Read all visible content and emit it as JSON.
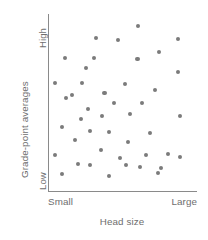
{
  "chart_data": {
    "type": "scatter",
    "title": "",
    "xlabel": "Head size",
    "ylabel": "Grade-point averages",
    "xtick_labels": [
      "Small",
      "Large"
    ],
    "ytick_labels": [
      "Low",
      "High"
    ],
    "xlim": [
      0,
      1
    ],
    "ylim": [
      0,
      1
    ],
    "grid": false,
    "legend": null,
    "annotation": "No association: grade-point averages show no relationship to head size",
    "point_color": "#7b7b7b",
    "axis_color": "#8a8a8a",
    "text_color": "#6e6e6e",
    "n_points": 44,
    "points": [
      {
        "x": 0.604,
        "y": 0.933
      },
      {
        "x": 0.322,
        "y": 0.866
      },
      {
        "x": 0.872,
        "y": 0.86
      },
      {
        "x": 0.47,
        "y": 0.854
      },
      {
        "x": 0.745,
        "y": 0.787
      },
      {
        "x": 0.114,
        "y": 0.753
      },
      {
        "x": 0.601,
        "y": 0.747
      },
      {
        "x": 0.309,
        "y": 0.753
      },
      {
        "x": 0.872,
        "y": 0.674
      },
      {
        "x": 0.047,
        "y": 0.612
      },
      {
        "x": 0.228,
        "y": 0.612
      },
      {
        "x": 0.517,
        "y": 0.607
      },
      {
        "x": 0.718,
        "y": 0.573
      },
      {
        "x": 0.379,
        "y": 0.556
      },
      {
        "x": 0.121,
        "y": 0.528
      },
      {
        "x": 0.268,
        "y": 0.466
      },
      {
        "x": 0.55,
        "y": 0.438
      },
      {
        "x": 0.886,
        "y": 0.427
      },
      {
        "x": 0.362,
        "y": 0.427
      },
      {
        "x": 0.221,
        "y": 0.41
      },
      {
        "x": 0.094,
        "y": 0.365
      },
      {
        "x": 0.282,
        "y": 0.343
      },
      {
        "x": 0.409,
        "y": 0.337
      },
      {
        "x": 0.685,
        "y": 0.331
      },
      {
        "x": 0.181,
        "y": 0.292
      },
      {
        "x": 0.537,
        "y": 0.281
      },
      {
        "x": 0.356,
        "y": 0.236
      },
      {
        "x": 0.047,
        "y": 0.208
      },
      {
        "x": 0.658,
        "y": 0.208
      },
      {
        "x": 0.805,
        "y": 0.213
      },
      {
        "x": 0.886,
        "y": 0.197
      },
      {
        "x": 0.483,
        "y": 0.191
      },
      {
        "x": 0.201,
        "y": 0.157
      },
      {
        "x": 0.282,
        "y": 0.152
      },
      {
        "x": 0.617,
        "y": 0.14
      },
      {
        "x": 0.758,
        "y": 0.135
      },
      {
        "x": 0.094,
        "y": 0.101
      },
      {
        "x": 0.409,
        "y": 0.09
      },
      {
        "x": 0.523,
        "y": 0.152
      },
      {
        "x": 0.161,
        "y": 0.545
      },
      {
        "x": 0.443,
        "y": 0.5
      },
      {
        "x": 0.631,
        "y": 0.5
      },
      {
        "x": 0.255,
        "y": 0.697
      },
      {
        "x": 0.738,
        "y": 0.107
      }
    ]
  },
  "axes": {
    "y_title": "Grade-point averages",
    "y_tick_high": "High",
    "y_tick_low": "Low",
    "x_tick_small": "Small",
    "x_tick_large": "Large",
    "x_title": "Head size"
  }
}
